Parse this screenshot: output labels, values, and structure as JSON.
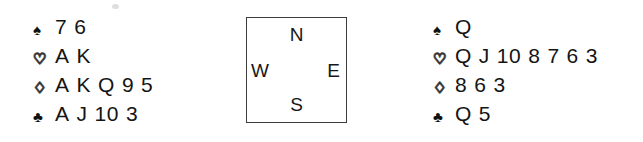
{
  "diagram": {
    "type": "bridge-hand-diagram",
    "background_color": "#ffffff",
    "ink_color": "#141414",
    "border_color": "#3c3c3c"
  },
  "suit_symbols": {
    "spades": "♠",
    "hearts": "♡",
    "diamonds": "♢",
    "clubs": "♣"
  },
  "compass": {
    "north": "N",
    "east": "E",
    "south": "S",
    "west": "W"
  },
  "hands": [
    {
      "position": "west",
      "suits": [
        {
          "suit": "spades",
          "symbol": "♠",
          "fill": "black",
          "cards": [
            "7",
            "6"
          ]
        },
        {
          "suit": "hearts",
          "symbol": "♡",
          "fill": "white",
          "cards": [
            "A",
            "K"
          ]
        },
        {
          "suit": "diamonds",
          "symbol": "♢",
          "fill": "white",
          "cards": [
            "A",
            "K",
            "Q",
            "9",
            "5"
          ]
        },
        {
          "suit": "clubs",
          "symbol": "♣",
          "fill": "black",
          "cards": [
            "A",
            "J",
            "10",
            "3"
          ]
        }
      ]
    },
    {
      "position": "east",
      "suits": [
        {
          "suit": "spades",
          "symbol": "♠",
          "fill": "black",
          "cards": [
            "Q"
          ]
        },
        {
          "suit": "hearts",
          "symbol": "♡",
          "fill": "white",
          "cards": [
            "Q",
            "J",
            "10",
            "8",
            "7",
            "6",
            "3"
          ]
        },
        {
          "suit": "diamonds",
          "symbol": "♢",
          "fill": "white",
          "cards": [
            "8",
            "6",
            "3"
          ]
        },
        {
          "suit": "clubs",
          "symbol": "♣",
          "fill": "black",
          "cards": [
            "Q",
            "5"
          ]
        }
      ]
    }
  ]
}
